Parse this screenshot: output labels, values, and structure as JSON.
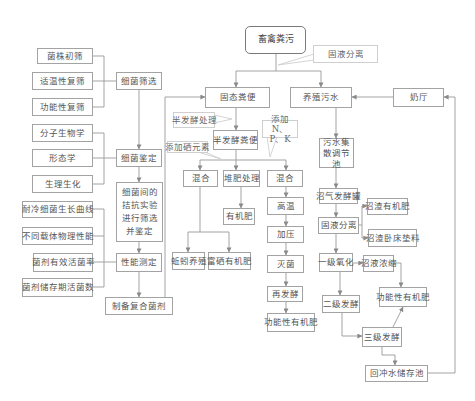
{
  "diagram": {
    "root": {
      "label": "畜禽粪污"
    },
    "callouts": {
      "solid_liquid_separation": "固液分离",
      "semi_fermentation_treatment": "半发酵处理",
      "add_npk": "添加N、P、K",
      "add_selenium": "添加硒元素"
    },
    "bacteria_section": {
      "screening_inputs": [
        "菌株初筛",
        "适温性复筛",
        "功能性复筛"
      ],
      "screening": "细菌筛选",
      "identification_inputs": [
        "分子生物学",
        "形态学",
        "生理生化"
      ],
      "identification": "细菌鉴定",
      "antagonism": "细菌间的拮抗实验进行筛选并鉴定",
      "performance_inputs": [
        "耐冷细菌生长曲线",
        "不同载体物理性能",
        "菌剂有效活菌率",
        "菌剂储存期活菌数"
      ],
      "performance": "性能测定",
      "compound_agent": "制备复合菌剂"
    },
    "solid_section": {
      "solid_manure": "固态粪便",
      "semi_fermented_manure": "半发酵粪便",
      "mix_left": "混合",
      "composting": "堆肥处理",
      "mix_right": "混合",
      "organic_fertilizer": "有机肥",
      "earthworm_breeding": "蚯蚓养殖",
      "selenium_organic_fertilizer": "富硒有机肥",
      "high_temperature": "高温",
      "pressurize": "加压",
      "sterilize": "灭菌",
      "refermentation": "再发酵",
      "functional_organic_fertilizer": "功能性有机肥"
    },
    "liquid_section": {
      "wastewater": "养殖污水",
      "dairy_hall": "奶厅",
      "regulating_pool": "污水集散调节池",
      "biogas_tank": "沼气发酵罐",
      "biogas_residue_fertilizer": "沼渣有机肥",
      "solid_liquid_separation": "固液分离",
      "biogas_residue_bedding": "沼渣卧床垫料",
      "primary_oxidation": "一级氧化",
      "biogas_slurry_concentration": "沼液浓缩",
      "functional_organic_fertilizer": "功能性有机肥",
      "secondary_fermentation": "二级发酵",
      "tertiary_fermentation": "三级发酵",
      "backflush_water_pool": "回冲水储存池"
    }
  }
}
